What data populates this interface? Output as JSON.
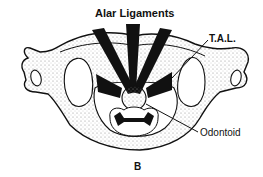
{
  "figure": {
    "panel_label": "B",
    "labels": {
      "alar": "Alar Ligaments",
      "tal": "T.A.L.",
      "odontoid": "Odontoid"
    }
  },
  "colors": {
    "ink": "#111111",
    "stipple": "#9a9a9a",
    "background": "#ffffff"
  }
}
